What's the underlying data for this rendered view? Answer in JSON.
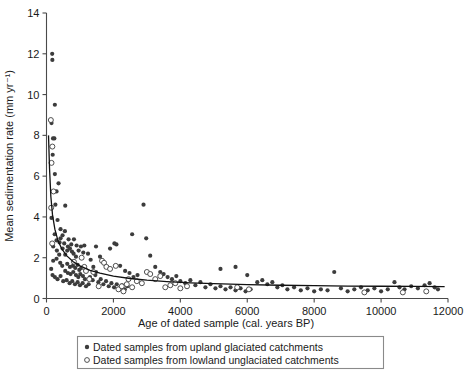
{
  "chart_data": {
    "type": "scatter",
    "title": "",
    "xlabel": "Age of dated sample (cal. years BP)",
    "ylabel": "Mean sedimentation rate (mm yr⁻¹)",
    "xlim": [
      0,
      12000
    ],
    "ylim": [
      0,
      14
    ],
    "xticks": [
      0,
      2000,
      4000,
      6000,
      8000,
      10000,
      12000
    ],
    "xtick_labels": [
      "0",
      "2000",
      "4000",
      "6000",
      "8000",
      "10000",
      "12000"
    ],
    "yticks": [
      0,
      2,
      4,
      6,
      8,
      10,
      12,
      14
    ],
    "ytick_labels": [
      "0",
      "2",
      "4",
      "6",
      "8",
      "10",
      "12",
      "14"
    ],
    "grid": false,
    "legend_position": "below-axes",
    "series": [
      {
        "name": "Dated samples from upland glaciated catchments",
        "marker": "filled-circle",
        "color": "#3c3c3c",
        "points": [
          [
            170,
            12.0
          ],
          [
            175,
            11.7
          ],
          [
            250,
            9.5
          ],
          [
            150,
            8.6
          ],
          [
            195,
            7.85
          ],
          [
            235,
            7.85
          ],
          [
            185,
            7.05
          ],
          [
            250,
            6.1
          ],
          [
            360,
            5.65
          ],
          [
            300,
            5.25
          ],
          [
            265,
            4.6
          ],
          [
            560,
            4.55
          ],
          [
            150,
            3.95
          ],
          [
            330,
            3.85
          ],
          [
            420,
            3.4
          ],
          [
            245,
            3.15
          ],
          [
            480,
            3.1
          ],
          [
            300,
            2.85
          ],
          [
            390,
            2.75
          ],
          [
            530,
            2.7
          ],
          [
            640,
            2.55
          ],
          [
            620,
            2.35
          ],
          [
            700,
            2.45
          ],
          [
            760,
            2.3
          ],
          [
            560,
            2.15
          ],
          [
            810,
            2.2
          ],
          [
            880,
            2.05
          ],
          [
            300,
            1.95
          ],
          [
            200,
            1.85
          ],
          [
            410,
            1.75
          ],
          [
            470,
            1.6
          ],
          [
            620,
            1.7
          ],
          [
            700,
            1.55
          ],
          [
            790,
            1.6
          ],
          [
            860,
            1.5
          ],
          [
            930,
            1.65
          ],
          [
            980,
            1.4
          ],
          [
            1040,
            1.5
          ],
          [
            560,
            1.35
          ],
          [
            640,
            1.25
          ],
          [
            720,
            1.2
          ],
          [
            800,
            1.3
          ],
          [
            880,
            1.15
          ],
          [
            950,
            1.05
          ],
          [
            1010,
            1.2
          ],
          [
            1090,
            1.1
          ],
          [
            1150,
            0.95
          ],
          [
            250,
            1.05
          ],
          [
            330,
            0.95
          ],
          [
            420,
            1.1
          ],
          [
            500,
            0.85
          ],
          [
            600,
            0.9
          ],
          [
            690,
            0.75
          ],
          [
            770,
            0.85
          ],
          [
            850,
            0.7
          ],
          [
            930,
            0.8
          ],
          [
            1000,
            0.65
          ],
          [
            1080,
            0.75
          ],
          [
            1180,
            0.6
          ],
          [
            1260,
            0.7
          ],
          [
            1130,
            2.6
          ],
          [
            1240,
            2.2
          ],
          [
            1320,
            1.9
          ],
          [
            1400,
            1.55
          ],
          [
            1480,
            1.3
          ],
          [
            1300,
            1.05
          ],
          [
            1380,
            0.9
          ],
          [
            1460,
            1.15
          ],
          [
            1550,
            0.8
          ],
          [
            1620,
            0.95
          ],
          [
            1700,
            0.7
          ],
          [
            1780,
            0.85
          ],
          [
            1860,
            0.6
          ],
          [
            1940,
            0.75
          ],
          [
            2020,
            0.55
          ],
          [
            2100,
            0.7
          ],
          [
            2180,
            0.5
          ],
          [
            2260,
            0.65
          ],
          [
            2340,
            0.45
          ],
          [
            2420,
            0.6
          ],
          [
            1480,
            2.55
          ],
          [
            1600,
            2.05
          ],
          [
            1900,
            2.45
          ],
          [
            2030,
            2.7
          ],
          [
            2090,
            2.65
          ],
          [
            2200,
            1.6
          ],
          [
            2350,
            1.35
          ],
          [
            2480,
            1.25
          ],
          [
            2600,
            1.05
          ],
          [
            2720,
            1.15
          ],
          [
            2560,
            3.15
          ],
          [
            2900,
            4.6
          ],
          [
            2980,
            2.95
          ],
          [
            3100,
            2.1
          ],
          [
            3250,
            1.55
          ],
          [
            3400,
            1.3
          ],
          [
            3500,
            1.2
          ],
          [
            3620,
            1.05
          ],
          [
            3750,
            0.95
          ],
          [
            3880,
            1.1
          ],
          [
            4000,
            0.85
          ],
          [
            4150,
            0.75
          ],
          [
            4300,
            0.9
          ],
          [
            4450,
            0.65
          ],
          [
            4600,
            0.8
          ],
          [
            4750,
            0.55
          ],
          [
            4900,
            0.7
          ],
          [
            5050,
            0.5
          ],
          [
            5200,
            0.6
          ],
          [
            5350,
            0.45
          ],
          [
            5500,
            0.55
          ],
          [
            5650,
            0.4
          ],
          [
            5800,
            0.5
          ],
          [
            5950,
            0.35
          ],
          [
            6100,
            0.45
          ],
          [
            5200,
            1.45
          ],
          [
            5650,
            1.55
          ],
          [
            6000,
            1.15
          ],
          [
            6300,
            0.8
          ],
          [
            6450,
            0.9
          ],
          [
            6600,
            0.7
          ],
          [
            6750,
            0.8
          ],
          [
            6900,
            0.55
          ],
          [
            7050,
            0.65
          ],
          [
            7200,
            0.45
          ],
          [
            7400,
            0.55
          ],
          [
            7600,
            0.4
          ],
          [
            7800,
            0.5
          ],
          [
            8000,
            0.35
          ],
          [
            8200,
            0.45
          ],
          [
            8600,
            1.3
          ],
          [
            8400,
            0.4
          ],
          [
            8800,
            0.5
          ],
          [
            9000,
            0.35
          ],
          [
            9200,
            0.45
          ],
          [
            9400,
            0.55
          ],
          [
            9600,
            0.4
          ],
          [
            9800,
            0.5
          ],
          [
            10000,
            0.35
          ],
          [
            10200,
            0.45
          ],
          [
            10400,
            0.8
          ],
          [
            10550,
            0.55
          ],
          [
            10700,
            0.45
          ],
          [
            10900,
            0.6
          ],
          [
            11100,
            0.5
          ],
          [
            11300,
            0.65
          ],
          [
            11450,
            0.75
          ],
          [
            11600,
            0.55
          ],
          [
            11700,
            0.45
          ],
          [
            420,
            2.95
          ],
          [
            480,
            2.45
          ],
          [
            550,
            3.3
          ],
          [
            660,
            2.9
          ],
          [
            740,
            2.65
          ],
          [
            820,
            2.9
          ],
          [
            900,
            2.6
          ],
          [
            960,
            2.35
          ],
          [
            1030,
            2.55
          ],
          [
            1100,
            2.25
          ],
          [
            310,
            2.35
          ],
          [
            380,
            2.15
          ],
          [
            200,
            2.55
          ],
          [
            140,
            1.45
          ],
          [
            180,
            1.15
          ]
        ]
      },
      {
        "name": "Dated samples from lowland unglaciated catchments",
        "marker": "open-circle",
        "color": "#3c3c3c",
        "points": [
          [
            130,
            8.75
          ],
          [
            175,
            7.45
          ],
          [
            150,
            6.65
          ],
          [
            210,
            5.25
          ],
          [
            140,
            4.45
          ],
          [
            170,
            2.7
          ],
          [
            820,
            1.8
          ],
          [
            1280,
            0.95
          ],
          [
            1400,
            1.3
          ],
          [
            1560,
            0.6
          ],
          [
            1660,
            1.85
          ],
          [
            1720,
            1.75
          ],
          [
            1790,
            1.55
          ],
          [
            1900,
            1.45
          ],
          [
            2070,
            1.6
          ],
          [
            2150,
            0.45
          ],
          [
            2300,
            0.35
          ],
          [
            2450,
            0.95
          ],
          [
            2560,
            0.55
          ],
          [
            2700,
            0.85
          ],
          [
            2850,
            0.75
          ],
          [
            3000,
            1.3
          ],
          [
            3100,
            1.2
          ],
          [
            3250,
            0.95
          ],
          [
            3400,
            1.1
          ],
          [
            3550,
            0.55
          ],
          [
            3700,
            0.65
          ],
          [
            3850,
            0.75
          ],
          [
            4000,
            0.5
          ],
          [
            4200,
            0.6
          ],
          [
            2250,
            0.6
          ],
          [
            2400,
            0.7
          ],
          [
            1050,
            2.0
          ],
          [
            1130,
            1.55
          ],
          [
            1180,
            1.35
          ],
          [
            5700,
            0.55
          ],
          [
            6050,
            0.45
          ],
          [
            9500,
            0.3
          ],
          [
            10650,
            0.3
          ],
          [
            11350,
            0.35
          ]
        ]
      }
    ],
    "fit_curve": {
      "description": "power-law decay best-fit line",
      "points": [
        [
          60,
          8.0
        ],
        [
          90,
          6.4
        ],
        [
          130,
          5.0
        ],
        [
          180,
          4.1
        ],
        [
          250,
          3.4
        ],
        [
          340,
          2.85
        ],
        [
          450,
          2.45
        ],
        [
          600,
          2.1
        ],
        [
          800,
          1.8
        ],
        [
          1000,
          1.6
        ],
        [
          1300,
          1.38
        ],
        [
          1600,
          1.24
        ],
        [
          2000,
          1.1
        ],
        [
          2500,
          0.98
        ],
        [
          3000,
          0.9
        ],
        [
          3600,
          0.83
        ],
        [
          4300,
          0.77
        ],
        [
          5000,
          0.73
        ],
        [
          6000,
          0.68
        ],
        [
          7000,
          0.65
        ],
        [
          8000,
          0.63
        ],
        [
          9000,
          0.61
        ],
        [
          10000,
          0.6
        ],
        [
          11000,
          0.59
        ],
        [
          11900,
          0.58
        ]
      ]
    }
  },
  "legend": {
    "items": [
      {
        "marker": "filled-circle",
        "label": "Dated samples from upland glaciated catchments"
      },
      {
        "marker": "open-circle",
        "label": "Dated samples from lowland unglaciated catchments"
      }
    ]
  },
  "colors": {
    "marker": "#3c3c3c",
    "axis": "#4a4a4a",
    "curve": "#111111",
    "legend_border": "#8a8a8a",
    "background": "#ffffff"
  }
}
